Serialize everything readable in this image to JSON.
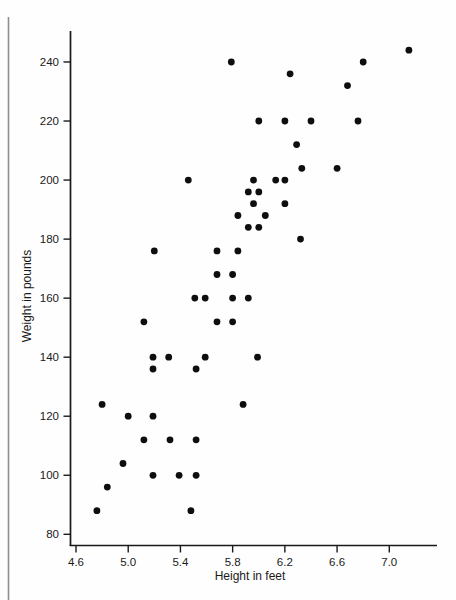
{
  "chart_data": {
    "type": "scatter",
    "title": "",
    "xlabel": "Height in feet",
    "ylabel": "Weight in pounds",
    "x_tick_labels": [
      "4.6",
      "5.0",
      "5.4",
      "5.8",
      "6.2",
      "6.6",
      "7.0"
    ],
    "y_tick_labels": [
      "80",
      "100",
      "120",
      "140",
      "160",
      "180",
      "200",
      "220",
      "240"
    ],
    "xlim": [
      4.55,
      7.37
    ],
    "ylim": [
      76,
      254
    ],
    "grid": false,
    "legend": "none",
    "point_color": "#0e0e0e",
    "axis_color": "#1a1a1a",
    "page_edge_color": "#8f8f8f",
    "points": [
      [
        4.76,
        88
      ],
      [
        4.84,
        96
      ],
      [
        4.8,
        124
      ],
      [
        4.96,
        104
      ],
      [
        5.0,
        120
      ],
      [
        5.12,
        112
      ],
      [
        5.12,
        152
      ],
      [
        5.19,
        100
      ],
      [
        5.19,
        120
      ],
      [
        5.19,
        136
      ],
      [
        5.19,
        140
      ],
      [
        5.2,
        176
      ],
      [
        5.31,
        140
      ],
      [
        5.32,
        112
      ],
      [
        5.39,
        100
      ],
      [
        5.46,
        200
      ],
      [
        5.48,
        88
      ],
      [
        5.51,
        160
      ],
      [
        5.52,
        100
      ],
      [
        5.52,
        112
      ],
      [
        5.52,
        136
      ],
      [
        5.59,
        140
      ],
      [
        5.59,
        160
      ],
      [
        5.68,
        152
      ],
      [
        5.68,
        168
      ],
      [
        5.68,
        176
      ],
      [
        5.79,
        240
      ],
      [
        5.8,
        152
      ],
      [
        5.8,
        160
      ],
      [
        5.8,
        168
      ],
      [
        5.84,
        176
      ],
      [
        5.84,
        188
      ],
      [
        5.88,
        124
      ],
      [
        5.92,
        160
      ],
      [
        5.92,
        184
      ],
      [
        5.92,
        196
      ],
      [
        5.96,
        192
      ],
      [
        5.96,
        200
      ],
      [
        5.99,
        140
      ],
      [
        6.0,
        184
      ],
      [
        6.0,
        196
      ],
      [
        6.0,
        220
      ],
      [
        6.05,
        188
      ],
      [
        6.13,
        200
      ],
      [
        6.2,
        192
      ],
      [
        6.2,
        200
      ],
      [
        6.2,
        220
      ],
      [
        6.24,
        236
      ],
      [
        6.29,
        212
      ],
      [
        6.32,
        180
      ],
      [
        6.33,
        204
      ],
      [
        6.4,
        220
      ],
      [
        6.6,
        204
      ],
      [
        6.68,
        232
      ],
      [
        6.76,
        220
      ],
      [
        6.8,
        240
      ],
      [
        7.15,
        244
      ]
    ]
  }
}
